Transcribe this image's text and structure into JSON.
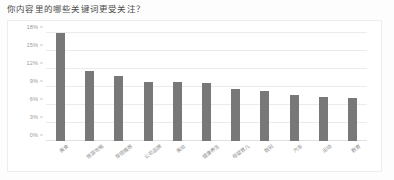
{
  "question": {
    "title": "你内容里的哪些关键词更受关注？"
  },
  "chart_data": {
    "type": "bar",
    "title": "你内容里的哪些关键词更受关注？",
    "xlabel": "",
    "ylabel": "",
    "ylim": [
      0,
      18
    ],
    "yticks": [
      "0%",
      "3%",
      "6%",
      "9%",
      "12%",
      "15%",
      "18%"
    ],
    "ytick_values": [
      0,
      3,
      6,
      9,
      12,
      15,
      18
    ],
    "grid": true,
    "legend": "none",
    "unit": "%",
    "bar_color": "#787878",
    "categories": [
      "美食",
      "旅游攻略",
      "穿搭推荐",
      "公司品牌",
      "美妆",
      "健康养生",
      "母婴育儿",
      "数码",
      "汽车",
      "运动",
      "教育"
    ],
    "values": [
      18.0,
      11.6,
      10.8,
      9.9,
      9.8,
      9.7,
      8.6,
      8.3,
      7.6,
      7.3,
      7.2
    ]
  }
}
